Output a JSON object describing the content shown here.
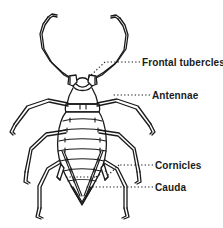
{
  "figure": {
    "background_color": "#ffffff",
    "ink_color": "#1a1a1a"
  },
  "labels": [
    {
      "id": "frontal-tubercles",
      "text": "Frontal tubercles",
      "leader": "dotted",
      "points_to": "head-frontal-tubercle"
    },
    {
      "id": "antennae",
      "text": "Antennae",
      "leader": "dotted",
      "points_to": "antenna-right"
    },
    {
      "id": "cornicles",
      "text": "Cornicles",
      "leader": "dotted",
      "points_to": "cornicle-right"
    },
    {
      "id": "cauda",
      "text": "Cauda",
      "leader": "dotted",
      "points_to": "cauda-tip"
    }
  ],
  "anatomy": {
    "body_parts": [
      "antennae",
      "frontal tubercles",
      "head",
      "thorax",
      "abdomen",
      "abdominal segments",
      "cornicles",
      "cauda",
      "legs"
    ],
    "abdominal_segment_count": 8,
    "leg_count": 6,
    "antenna_count": 2,
    "cornicle_count": 2
  }
}
